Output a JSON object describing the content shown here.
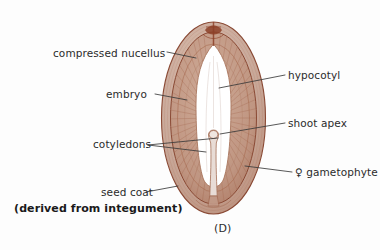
{
  "figure": {
    "caption": "(D)",
    "background_color": "#fdfdfd"
  },
  "labels": {
    "compressed_nucellus": "compressed nucellus",
    "embryo": "embryo",
    "cotyledons": "cotyledons",
    "seed_coat": "seed coat",
    "derived_from_integument": "(derived from integument)",
    "hypocotyl": "hypocotyl",
    "shoot_apex": "shoot apex",
    "female_gametophyte": "♀ gametophyte"
  },
  "colors": {
    "seed_coat_fill": "#c9a99a",
    "seed_coat_outline": "#8a4a35",
    "gametophyte_fill": "#c29a88",
    "gametophyte_striation": "#9c5f46",
    "inner_band": "#b07d66",
    "embryo_cavity": "#ffffff",
    "embryo_axis": "#e8dcd6",
    "micropyle": "#8c3f27",
    "leader_line": "#3a3a3a",
    "label_text": "#2b2b2b",
    "emphasis_text": "#1a1a1a"
  },
  "structures": [
    {
      "name": "seed-coat",
      "description": "outer pinkish-brown ovate rim derived from integument"
    },
    {
      "name": "compressed-nucellus",
      "description": "thin dark layer just inside seed coat at apex"
    },
    {
      "name": "female-gametophyte",
      "description": "radially striated nutritive tissue filling seed interior"
    },
    {
      "name": "embryo-cavity",
      "description": "white pointed-oval chamber containing the embryo"
    },
    {
      "name": "embryo-axis",
      "description": "slender central column with shoot apex knob at top"
    },
    {
      "name": "cotyledons",
      "description": "paired embryonic leaves within the cavity"
    },
    {
      "name": "hypocotyl",
      "description": "embryonic stem region of the embryo axis"
    },
    {
      "name": "shoot-apex",
      "description": "small knob at top of embryo axis"
    },
    {
      "name": "micropyle",
      "description": "dark reddish-brown structure at seed apex"
    }
  ]
}
